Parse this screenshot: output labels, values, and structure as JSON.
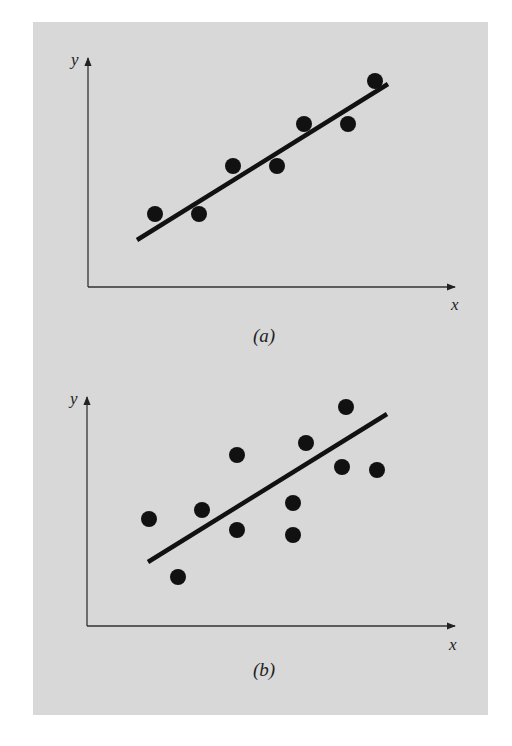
{
  "figure": {
    "background_color": "#d8d8d8",
    "ink_color": "#111111"
  },
  "chart_data": [
    {
      "type": "scatter",
      "title": "",
      "caption": "(a)",
      "xlabel": "x",
      "ylabel": "y",
      "grid": false,
      "legend": null,
      "axis_ticks": "none",
      "description": "Data points lying close to a linear least-squares fit line (good fit, small residuals)",
      "points_pixel": [
        [
          155,
          214
        ],
        [
          199,
          214
        ],
        [
          233,
          166
        ],
        [
          277,
          166
        ],
        [
          304,
          124
        ],
        [
          348,
          124
        ],
        [
          375,
          81
        ]
      ],
      "fit_line_pixel": [
        [
          137,
          240
        ],
        [
          388,
          84
        ]
      ],
      "axes_pixel": {
        "origin": [
          88,
          287
        ],
        "y_tip": [
          88,
          58
        ],
        "x_tip": [
          455,
          287
        ]
      },
      "label_positions": {
        "y": [
          71,
          65
        ],
        "x": [
          451,
          310
        ],
        "caption": [
          264,
          342
        ]
      }
    },
    {
      "type": "scatter",
      "title": "",
      "caption": "(b)",
      "xlabel": "x",
      "ylabel": "y",
      "grid": false,
      "legend": null,
      "axis_ticks": "none",
      "description": "Data points widely scattered around a linear least-squares fit line (poor fit, large residuals)",
      "points_pixel": [
        [
          149,
          519
        ],
        [
          178,
          577
        ],
        [
          202,
          510
        ],
        [
          237,
          455
        ],
        [
          237,
          530
        ],
        [
          293,
          503
        ],
        [
          293,
          535
        ],
        [
          306,
          443
        ],
        [
          342,
          467
        ],
        [
          346,
          407
        ],
        [
          377,
          470
        ]
      ],
      "fit_line_pixel": [
        [
          148,
          562
        ],
        [
          387,
          414
        ]
      ],
      "axes_pixel": {
        "origin": [
          87,
          626
        ],
        "y_tip": [
          87,
          397
        ],
        "x_tip": [
          455,
          626
        ]
      },
      "label_positions": {
        "y": [
          70,
          404
        ],
        "x": [
          449,
          650
        ],
        "caption": [
          264,
          676
        ]
      }
    }
  ],
  "labels": {
    "a": {
      "y": "y",
      "x": "x",
      "caption": "(a)"
    },
    "b": {
      "y": "y",
      "x": "x",
      "caption": "(b)"
    }
  }
}
